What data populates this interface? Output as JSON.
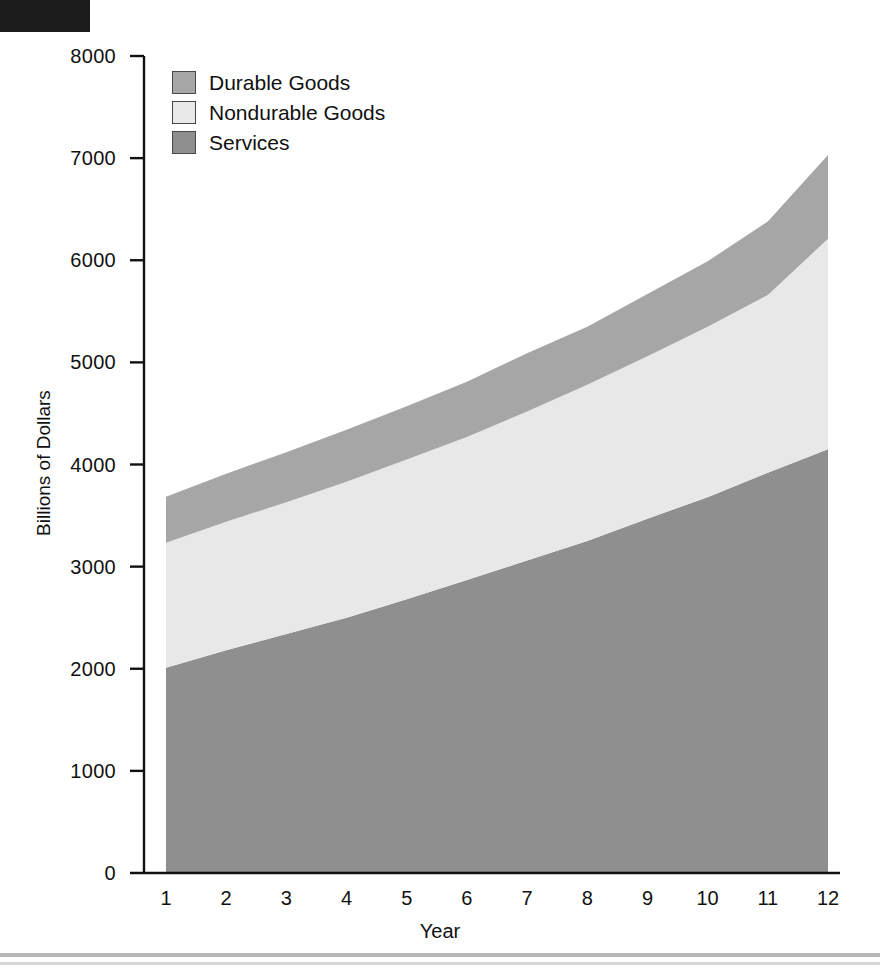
{
  "figure": {
    "background_color": "#ffffff",
    "top_black_bar": true,
    "bottom_rule": true
  },
  "legend": {
    "items": [
      {
        "label": "Durable Goods",
        "color": "#a6a6a6"
      },
      {
        "label": "Nondurable Goods",
        "color": "#e8e8e8"
      },
      {
        "label": "Services",
        "color": "#8f8f8f"
      }
    ]
  },
  "axes": {
    "y_title": "Billions of Dollars",
    "x_title": "Year",
    "y_ticks": [
      "0",
      "1000",
      "2000",
      "3000",
      "4000",
      "5000",
      "6000",
      "7000",
      "8000"
    ],
    "x_ticks": [
      "1",
      "2",
      "3",
      "4",
      "5",
      "6",
      "7",
      "8",
      "9",
      "10",
      "11",
      "12"
    ]
  },
  "chart_data": {
    "type": "area",
    "title": "",
    "subtitle": "",
    "xlabel": "Year",
    "ylabel": "Billions of Dollars",
    "stacked": true,
    "grid": false,
    "legend_position": "top-left",
    "xlim": [
      1,
      12
    ],
    "ylim": [
      0,
      8000
    ],
    "ytick_values": [
      0,
      1000,
      2000,
      3000,
      4000,
      5000,
      6000,
      7000,
      8000
    ],
    "x": [
      1,
      2,
      3,
      4,
      5,
      6,
      7,
      8,
      9,
      10,
      11,
      12
    ],
    "categories": [
      "1",
      "2",
      "3",
      "4",
      "5",
      "6",
      "7",
      "8",
      "9",
      "10",
      "11",
      "12"
    ],
    "series": [
      {
        "name": "Services",
        "color": "#8f8f8f",
        "values": [
          2010,
          2180,
          2340,
          2500,
          2680,
          2870,
          3060,
          3250,
          3470,
          3680,
          3920,
          4150
        ]
      },
      {
        "name": "Nondurable Goods",
        "color": "#e8e8e8",
        "values": [
          1225,
          1260,
          1290,
          1330,
          1370,
          1400,
          1460,
          1530,
          1590,
          1670,
          1740,
          2060
        ]
      },
      {
        "name": "Durable Goods",
        "color": "#a6a6a6",
        "values": [
          450,
          470,
          490,
          510,
          520,
          540,
          570,
          570,
          610,
          640,
          720,
          820
        ]
      }
    ],
    "cumulative_top": {
      "services_top": [
        2010,
        2180,
        2340,
        2500,
        2680,
        2870,
        3060,
        3250,
        3470,
        3680,
        3920,
        4150
      ],
      "nondurable_top": [
        3235,
        3440,
        3630,
        3830,
        4050,
        4270,
        4520,
        4780,
        5060,
        5350,
        5660,
        6210
      ],
      "durable_top": [
        3685,
        3910,
        4120,
        4340,
        4570,
        4810,
        5090,
        5350,
        5670,
        5990,
        6380,
        7030
      ]
    }
  }
}
